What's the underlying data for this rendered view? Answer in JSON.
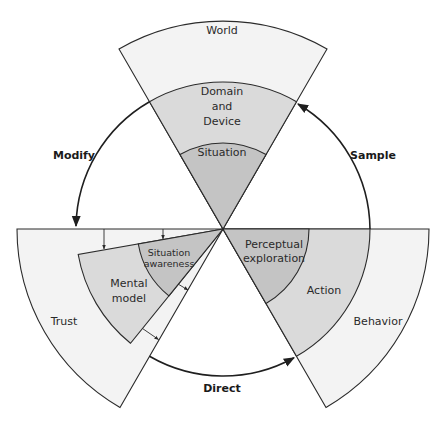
{
  "diagram": {
    "sectors": {
      "top": {
        "outer": "World",
        "middle_lines": [
          "Domain",
          "and",
          "Device"
        ],
        "inner": "Situation"
      },
      "left": {
        "outer": "Trust",
        "middle_lines": [
          "Mental",
          "model"
        ],
        "inner_lines": [
          "Situation",
          "awareness"
        ]
      },
      "right": {
        "outer": "Behavior",
        "middle": "Action",
        "inner_lines": [
          "Perceptual",
          "exploration"
        ]
      }
    },
    "cycle_arrows": {
      "modify": "Modify",
      "sample": "Sample",
      "direct": "Direct"
    },
    "colors": {
      "outer_fill": "#f3f3f3",
      "middle_fill": "#dadada",
      "inner_fill": "#c4c4c4",
      "stroke": "#2b2b2b"
    }
  }
}
